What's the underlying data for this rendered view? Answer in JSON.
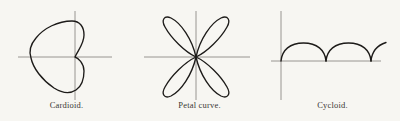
{
  "page": {
    "background_color": "#f7f6f2",
    "ink_color": "#1d1b19",
    "axis_color": "#8d8b87"
  },
  "figures": [
    {
      "id": "cardioid",
      "caption": "Cardioid.",
      "curve_type": "cardioid",
      "description": "Polar cardioid opening left with cusp on the vertical axis",
      "axes": {
        "x_axis": {
          "x1": 18,
          "y1": 57,
          "x2": 112,
          "y2": 57
        },
        "y_axis": {
          "x1": 75,
          "y1": 11,
          "x2": 75,
          "y2": 100
        }
      },
      "geometry": {
        "origin_x": 75,
        "origin_y": 57,
        "cusp_x": 75,
        "cusp_y": 57,
        "leftmost_x": 31,
        "top_y": 21,
        "bottom_y": 93,
        "lobe_radius": 22
      }
    },
    {
      "id": "petal-curve",
      "caption": "Petal curve.",
      "curve_type": "four-petal rose",
      "description": "Four-petal rose with petals along the diagonals",
      "petal_count": 4,
      "petal_angles_deg": [
        45,
        135,
        225,
        315
      ],
      "axes": {
        "x_axis": {
          "x1": 144,
          "y1": 57,
          "x2": 250,
          "y2": 57
        },
        "y_axis": {
          "x1": 196,
          "y1": 11,
          "x2": 196,
          "y2": 100
        }
      },
      "geometry": {
        "origin_x": 196,
        "origin_y": 57,
        "petal_length": 36,
        "petal_width": 17
      }
    },
    {
      "id": "cycloid",
      "caption": "Cycloid.",
      "curve_type": "cycloid",
      "description": "Cycloid with two full arches and a partial third arch rising at the right",
      "arch_count": 2.4,
      "axes": {
        "x_axis": {
          "x1": 272,
          "y1": 61,
          "x2": 382,
          "y2": 61
        },
        "y_axis": {
          "x1": 282,
          "y1": 11,
          "x2": 282,
          "y2": 100
        }
      },
      "geometry": {
        "origin_x": 282,
        "baseline_y": 61,
        "arch_period": 45,
        "arch_height": 18,
        "cusp_xs": [
          282,
          327,
          372
        ]
      }
    }
  ]
}
